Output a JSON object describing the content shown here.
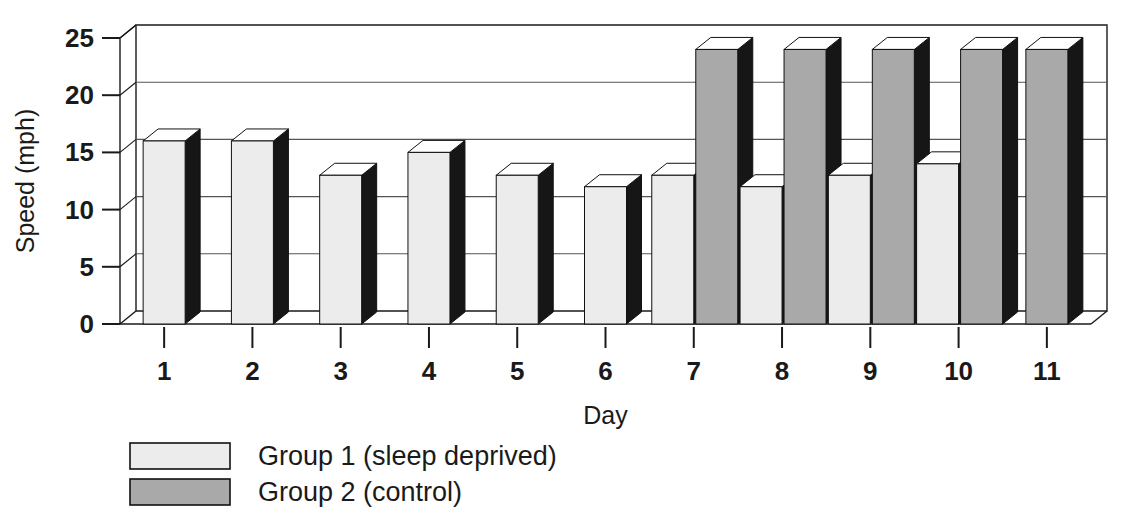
{
  "chart_data": {
    "type": "bar",
    "title": "",
    "subtitle": "",
    "xlabel": "Day",
    "ylabel": "Speed (mph)",
    "categories": [
      "1",
      "2",
      "3",
      "4",
      "5",
      "6",
      "7",
      "8",
      "9",
      "10",
      "11"
    ],
    "series": [
      {
        "name": "Group 1 (sleep deprived)",
        "color": "#ececec",
        "values": [
          16,
          16,
          13,
          15,
          13,
          12,
          13,
          12,
          13,
          14,
          null
        ]
      },
      {
        "name": "Group 2 (control)",
        "color": "#a9a9a9",
        "values": [
          null,
          null,
          null,
          null,
          null,
          null,
          24,
          24,
          24,
          24,
          24
        ]
      }
    ],
    "ylim": [
      0,
      25
    ],
    "yticks": [
      0,
      5,
      10,
      15,
      20,
      25
    ],
    "ytick_labels": [
      "0",
      "5",
      "10",
      "15",
      "20",
      "25"
    ],
    "xtick_labels": [
      "1",
      "2",
      "3",
      "4",
      "5",
      "6",
      "7",
      "8",
      "9",
      "10",
      "11"
    ],
    "grid": true,
    "grid_axis": "y",
    "legend_position": "below-left",
    "style": "3d-bars",
    "axis_color": "#1a1a1a",
    "grid_color": "#555555",
    "bar_side_color": "#161616",
    "bar_top_color": "#ffffff",
    "background": "#ffffff"
  },
  "legend": {
    "entries": [
      {
        "label": "Group 1 (sleep deprived)",
        "swatch": "#ececec"
      },
      {
        "label": "Group 2 (control)",
        "swatch": "#a9a9a9"
      }
    ]
  },
  "axes": {
    "y_title": "Speed (mph)",
    "x_title": "Day"
  }
}
